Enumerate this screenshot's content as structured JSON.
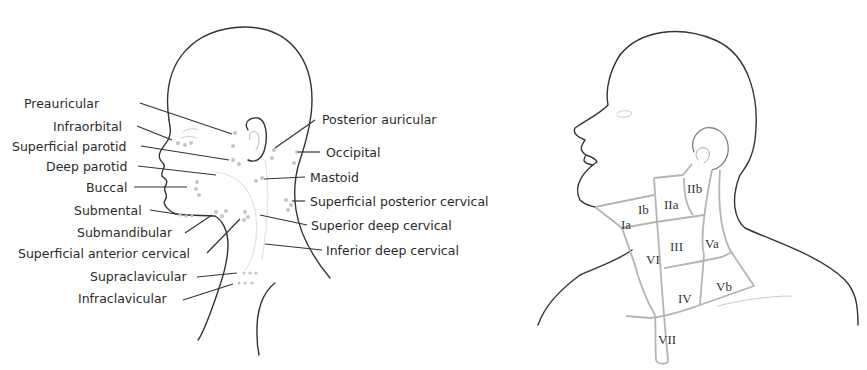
{
  "left_figure": {
    "title": "Lymph node groups of the head and neck",
    "labels_left": [
      {
        "id": "preauricular",
        "text": "Preauricular",
        "x": 24,
        "y": 97
      },
      {
        "id": "infraorbital",
        "text": "Infraorbital",
        "x": 53,
        "y": 120
      },
      {
        "id": "superficial-parotid",
        "text": "Superficial parotid",
        "x": 12,
        "y": 140
      },
      {
        "id": "deep-parotid",
        "text": "Deep parotid",
        "x": 46,
        "y": 160
      },
      {
        "id": "buccal",
        "text": "Buccal",
        "x": 86,
        "y": 181
      },
      {
        "id": "submental",
        "text": "Submental",
        "x": 74,
        "y": 204
      },
      {
        "id": "submandibular",
        "text": "Submandibular",
        "x": 77,
        "y": 226
      },
      {
        "id": "superficial-anterior-cervical",
        "text": "Superficial anterior cervical",
        "x": 18,
        "y": 247
      },
      {
        "id": "supraclavicular",
        "text": "Supraclavicular",
        "x": 90,
        "y": 270
      },
      {
        "id": "infraclavicular",
        "text": "Infraclavicular",
        "x": 78,
        "y": 292
      }
    ],
    "labels_right": [
      {
        "id": "posterior-auricular",
        "text": "Posterior auricular",
        "x": 322,
        "y": 113
      },
      {
        "id": "occipital",
        "text": "Occipital",
        "x": 326,
        "y": 146
      },
      {
        "id": "mastoid",
        "text": "Mastoid",
        "x": 310,
        "y": 171
      },
      {
        "id": "superficial-posterior-cervical",
        "text": "Superficial posterior cervical",
        "x": 310,
        "y": 195
      },
      {
        "id": "superior-deep-cervical",
        "text": "Superior deep cervical",
        "x": 311,
        "y": 219
      },
      {
        "id": "inferior-deep-cervical",
        "text": "Inferior deep cervical",
        "x": 326,
        "y": 244
      }
    ]
  },
  "right_figure": {
    "title": "Cervical lymph node levels",
    "levels": [
      {
        "id": "Ia",
        "text": "Ia",
        "x": 621,
        "y": 218
      },
      {
        "id": "Ib",
        "text": "Ib",
        "x": 638,
        "y": 203
      },
      {
        "id": "IIa",
        "text": "IIa",
        "x": 664,
        "y": 198
      },
      {
        "id": "IIb",
        "text": "IIb",
        "x": 687,
        "y": 182
      },
      {
        "id": "III",
        "text": "III",
        "x": 670,
        "y": 240
      },
      {
        "id": "Va",
        "text": "Va",
        "x": 705,
        "y": 237
      },
      {
        "id": "VI",
        "text": "VI",
        "x": 646,
        "y": 253
      },
      {
        "id": "IV",
        "text": "IV",
        "x": 678,
        "y": 292
      },
      {
        "id": "Vb",
        "text": "Vb",
        "x": 716,
        "y": 280
      },
      {
        "id": "VII",
        "text": "VII",
        "x": 658,
        "y": 333
      }
    ]
  },
  "colors": {
    "outline": "#333333",
    "region_border": "#b4b4b4",
    "node_dot": "#c4c4c4",
    "text": "#2a2a2a"
  }
}
